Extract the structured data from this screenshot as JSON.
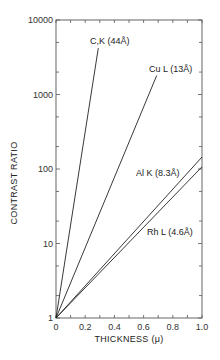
{
  "chart_data": {
    "type": "line",
    "title": "",
    "xlabel": "THICKNESS (μ)",
    "ylabel": "CONTRAST RATIO",
    "xlim": [
      0,
      1.0
    ],
    "ylim": [
      1,
      10000
    ],
    "yscale": "log",
    "grid": false,
    "legend": "inline labels",
    "x_ticks": [
      "0",
      "0.2",
      "0.4",
      "0.6",
      "0.8",
      "1.0"
    ],
    "x_tick_values": [
      0,
      0.2,
      0.4,
      0.6,
      0.8,
      1.0
    ],
    "y_ticks": [
      "1",
      "10",
      "100",
      "1000",
      "10000"
    ],
    "y_tick_values": [
      1,
      10,
      100,
      1000,
      10000
    ],
    "series": [
      {
        "name": "C,K (44Å)",
        "x": [
          0,
          0.29
        ],
        "y": [
          1,
          4200
        ]
      },
      {
        "name": "Cu L (13Å)",
        "x": [
          0,
          0.69
        ],
        "y": [
          1,
          1800
        ]
      },
      {
        "name": "Al K (8.3Å)",
        "x": [
          0,
          1.0
        ],
        "y": [
          1,
          145
        ]
      },
      {
        "name": "Rh L (4.6Å)",
        "x": [
          0,
          1.0
        ],
        "y": [
          1,
          107
        ]
      }
    ]
  }
}
